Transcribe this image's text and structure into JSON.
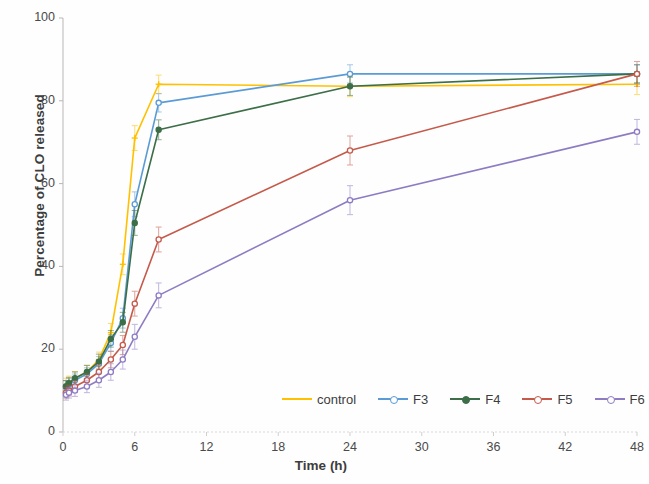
{
  "chart_data": {
    "type": "line",
    "title": "",
    "xlabel": "Time (h)",
    "ylabel": "Percentage of CLO released",
    "xlim": [
      0,
      48
    ],
    "ylim": [
      0,
      100
    ],
    "xticks": [
      "0",
      "6",
      "12",
      "18",
      "24",
      "30",
      "36",
      "42",
      "48"
    ],
    "yticks": [
      "0",
      "20",
      "40",
      "60",
      "80",
      "100"
    ],
    "grid": false,
    "legend_position": "bottom-right",
    "error_bars": true,
    "x": [
      0.25,
      0.5,
      1,
      2,
      3,
      4,
      5,
      6,
      8,
      24,
      48
    ],
    "series": [
      {
        "name": "control",
        "color": "#FFC000",
        "values": [
          11.5,
          12.0,
          13.0,
          14.5,
          17.5,
          24.0,
          40.5,
          71.0,
          84.0,
          83.5,
          84.0
        ],
        "errors": [
          1.5,
          1.5,
          1.6,
          1.6,
          1.8,
          2.2,
          2.5,
          3.0,
          2.2,
          2.5,
          2.5
        ]
      },
      {
        "name": "F3",
        "color": "#5B9BD5",
        "values": [
          11.0,
          11.5,
          12.5,
          14.0,
          16.5,
          21.5,
          27.5,
          55.0,
          79.5,
          86.5,
          86.5
        ],
        "errors": [
          1.4,
          1.4,
          1.5,
          1.5,
          1.7,
          2.0,
          2.4,
          3.0,
          2.2,
          2.2,
          2.2
        ]
      },
      {
        "name": "F4",
        "color": "#3C6E47",
        "values": [
          11.0,
          11.8,
          13.0,
          14.5,
          17.0,
          22.5,
          26.5,
          50.5,
          73.0,
          83.5,
          86.5
        ],
        "errors": [
          1.4,
          1.4,
          1.5,
          1.6,
          1.8,
          2.0,
          2.4,
          3.0,
          2.4,
          2.2,
          2.2
        ]
      },
      {
        "name": "F5",
        "color": "#C55A4A",
        "values": [
          9.5,
          10.0,
          11.0,
          12.5,
          14.5,
          17.5,
          21.0,
          31.0,
          46.5,
          68.0,
          86.5
        ],
        "errors": [
          1.3,
          1.3,
          1.4,
          1.5,
          1.7,
          2.0,
          2.3,
          3.0,
          3.0,
          3.5,
          3.0
        ]
      },
      {
        "name": "F6",
        "color": "#8E7CC3",
        "values": [
          9.0,
          9.5,
          10.0,
          11.0,
          12.5,
          14.5,
          17.5,
          23.0,
          33.0,
          56.0,
          72.5
        ],
        "errors": [
          1.3,
          1.3,
          1.4,
          1.5,
          1.7,
          2.0,
          2.3,
          3.0,
          3.0,
          3.5,
          3.0
        ]
      }
    ]
  },
  "axes": {
    "ylabel": "Percentage of CLO released",
    "xlabel": "Time (h)"
  },
  "legend": {
    "items": [
      {
        "label": "control"
      },
      {
        "label": "F3"
      },
      {
        "label": "F4"
      },
      {
        "label": "F5"
      },
      {
        "label": "F6"
      }
    ]
  }
}
